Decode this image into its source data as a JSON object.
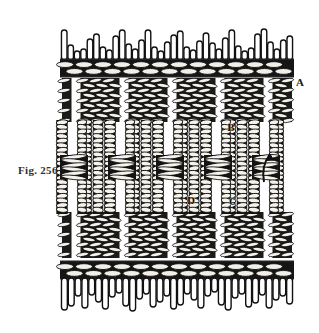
{
  "figure": {
    "caption": "Fig. 256",
    "background_color": "#ffffff",
    "ink_color": "#111111",
    "caption_color": "#3a2f2a"
  },
  "labels": [
    {
      "id": "A",
      "text": "A",
      "x": 300,
      "y": 86,
      "note": "upper-right-selvedge-band"
    },
    {
      "id": "B",
      "text": "B",
      "x": 231,
      "y": 131,
      "note": "vertical-cord-upper"
    },
    {
      "id": "C",
      "text": "C",
      "x": 233,
      "y": 205,
      "note": "vertical-cord-lower"
    },
    {
      "id": "D",
      "text": "D",
      "x": 191,
      "y": 204,
      "note": "crossing-cord"
    }
  ],
  "annotations": {
    "arrow": {
      "name": "curved-arrow",
      "x": 268,
      "y": 165,
      "direction": "up"
    }
  },
  "panel": {
    "left": 62,
    "right": 292,
    "top": 78,
    "bottom": 258,
    "weave_top_band": {
      "y": 78,
      "height": 44
    },
    "weave_bottom_band": {
      "y": 212,
      "height": 46
    }
  },
  "bands": [
    {
      "name": "upper-cord-band",
      "y": 60,
      "height": 16
    },
    {
      "name": "lower-cord-band",
      "y": 262,
      "height": 16
    }
  ],
  "fringe": {
    "top": {
      "name": "top-fringe",
      "baseline_y": 60,
      "count": 36,
      "lengths": [
        30,
        15,
        9,
        11,
        21,
        26,
        13,
        10,
        24,
        30,
        16,
        11,
        20,
        30,
        13,
        9,
        18,
        25,
        29,
        13,
        10,
        19,
        27,
        17,
        11,
        22,
        30,
        14,
        9,
        12,
        26,
        31,
        18,
        11,
        20,
        24
      ]
    },
    "bottom": {
      "name": "bottom-fringe",
      "baseline_y": 278,
      "count": 34,
      "lengths": [
        32,
        28,
        18,
        30,
        17,
        24,
        31,
        19,
        15,
        28,
        33,
        21,
        16,
        29,
        24,
        18,
        31,
        27,
        16,
        22,
        30,
        18,
        14,
        27,
        32,
        20,
        16,
        29,
        25,
        17,
        30,
        22,
        18,
        26
      ]
    }
  },
  "weave": {
    "vertical_columns": [
      62,
      86,
      110,
      134,
      158,
      182,
      206,
      230,
      254,
      278
    ],
    "open_gaps": [
      76,
      124,
      172,
      220,
      268
    ],
    "cord_rows_top": 9,
    "cord_rows_bottom": 9
  }
}
